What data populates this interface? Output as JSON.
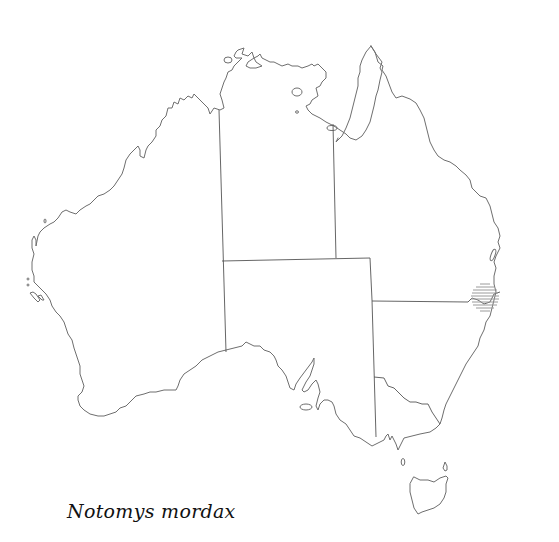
{
  "map": {
    "region": "Australia",
    "style": "outline map with state borders",
    "colors": {
      "background": "#ffffff",
      "coastline": "#6e6e6e",
      "state_borders": "#555555",
      "range_hatch": "#9a9a9a",
      "title_text": "#111111"
    },
    "range_marker": {
      "shape": "hatched-circle",
      "center_x": 485,
      "center_y": 297,
      "radius": 14,
      "location_description": "northern New South Wales / southern Queensland border near coast"
    }
  },
  "caption": {
    "species_name": "Notomys mordax"
  }
}
